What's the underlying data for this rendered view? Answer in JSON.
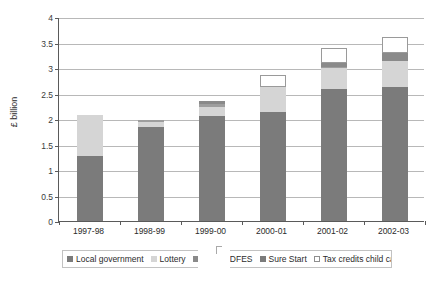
{
  "chart_data": {
    "type": "bar",
    "stacked": true,
    "title": "",
    "xlabel": "",
    "ylabel": "£ billion",
    "ylim": [
      0,
      4
    ],
    "ytick_step": 0.5,
    "grid": true,
    "legend_position": "bottom",
    "categories": [
      "1997-98",
      "1998-99",
      "1999-00",
      "2000-01",
      "2001-02",
      "2002-03"
    ],
    "ytick_labels": [
      "0",
      "0.5",
      "1",
      "1.5",
      "2",
      "2.5",
      "3",
      "3.5",
      "4"
    ],
    "series": [
      {
        "name": "Local government",
        "color": "#7b7b7b",
        "values": [
          1.27,
          1.84,
          2.05,
          2.14,
          2.58,
          2.62
        ]
      },
      {
        "name": "Lottery",
        "color": "#d5d5d5",
        "values": [
          0.8,
          0.1,
          0.19,
          0.48,
          0.42,
          0.51
        ]
      },
      {
        "name": "Other DFES",
        "color": "#9e9e9e",
        "values": [
          0.0,
          0.04,
          0.05,
          0.0,
          0.03,
          0.0
        ]
      },
      {
        "name": "Sure Start",
        "color": "#8a8a8a",
        "values": [
          0.0,
          0.0,
          0.06,
          0.0,
          0.07,
          0.17
        ]
      },
      {
        "name": "Tax credits child care",
        "color": "#ffffff",
        "values": [
          0.0,
          0.0,
          0.0,
          0.24,
          0.3,
          0.3
        ]
      }
    ],
    "totals": [
      2.07,
      1.98,
      2.35,
      2.86,
      3.4,
      3.6
    ]
  },
  "legend": {
    "items": [
      {
        "label": "Local government",
        "swatch": "#7b7b7b",
        "outlined": false
      },
      {
        "label": "Lottery",
        "swatch": "#d5d5d5",
        "outlined": false
      },
      {
        "label": "Other",
        "swatch": "#8a8a8a",
        "outlined": false
      },
      {
        "label": "DFES",
        "swatch": null,
        "outlined": false
      },
      {
        "label": "Sure Start",
        "swatch": "#7b7b7b",
        "outlined": false
      },
      {
        "label": "Tax credits child care",
        "swatch": "#ffffff",
        "outlined": true
      }
    ]
  },
  "colors": {
    "axis": "#5a5a5a",
    "grid": "#b8b8b8",
    "background": "#ffffff",
    "text": "#2b2b2b"
  }
}
